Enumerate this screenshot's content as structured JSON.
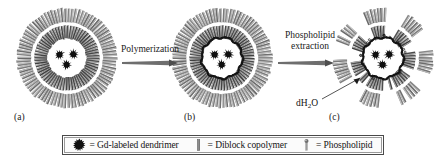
{
  "figure": {
    "type": "scientific-schematic",
    "background_color": "#ffffff"
  },
  "panels": [
    {
      "id": "a",
      "label": "(a)",
      "center_x": 67,
      "center_y": 58,
      "outer_radius": 50,
      "dendrimer_count": 3,
      "has_polymer_ring": false,
      "shell_style": "full-phospholipid-bilayer"
    },
    {
      "id": "b",
      "label": "(b)",
      "center_x": 222,
      "center_y": 58,
      "outer_radius": 50,
      "dendrimer_count": 3,
      "has_polymer_ring": true,
      "shell_style": "full-bilayer-with-polymer"
    },
    {
      "id": "c",
      "label": "(c)",
      "center_x": 383,
      "center_y": 58,
      "outer_radius": 50,
      "dendrimer_count": 3,
      "has_polymer_ring": true,
      "shell_style": "sparse-patchy-after-extraction"
    }
  ],
  "arrows": [
    {
      "name": "polymerization",
      "label_lines": [
        "Polymerization"
      ],
      "x1": 122,
      "x2": 178,
      "y": 63
    },
    {
      "name": "phospholipid-extraction",
      "label_lines": [
        "Phospholipid",
        "extraction"
      ],
      "x1": 278,
      "x2": 334,
      "y": 63
    }
  ],
  "annotations": {
    "dh2o": {
      "text_prefix": "dH",
      "text_sub": "2",
      "text_suffix": "O",
      "leader_from_x": 322,
      "leader_from_y": 99,
      "leader_to_x": 360,
      "leader_to_y": 78
    }
  },
  "legend": {
    "entries": [
      {
        "icon": "dendrimer-star-icon",
        "text": "= Gd-labeled dendrimer"
      },
      {
        "icon": "diblock-copolymer-bar-icon",
        "text": "= Diblock copolymer"
      },
      {
        "icon": "phospholipid-icon",
        "text": "= Phospholipid"
      }
    ]
  },
  "colors": {
    "lipid_gray": "#8c8c8c",
    "lipid_dark": "#5a5a5a",
    "polymer_black": "#141414",
    "dendrimer_black": "#101010",
    "arrow_gray": "#6e6e6e",
    "text_black": "#141414",
    "lumen_white": "#ffffff",
    "legend_border": "#4a4a4a"
  }
}
